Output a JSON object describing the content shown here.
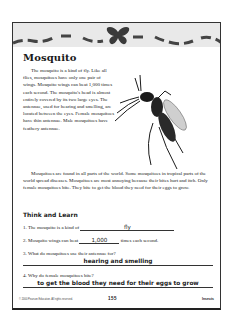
{
  "worksheet": {
    "title": "Mosquito",
    "paragraph1": "The mosquito is a kind of fly. Like all flies, mosquitoes have only one pair of wings. Mosquito wings can beat 1,000 times each second. The mosquito's head is almost entirely covered by its two large eyes. The antennae, used for hearing and smelling, are located between the eyes. Female mosquitoes have thin antennae. Male mosquitoes have feathery antennae.",
    "paragraph2": "Mosquitoes are found in all parts of the world. Some mosquitoes in tropical parts of the world spread diseases. Mosquitoes are most annoying because their bites hurt and itch. Only female mosquitoes bite. They bite to get the blood they need for their eggs to grow.",
    "section_heading": "Think and Learn",
    "questions": [
      {
        "number": "1.",
        "prompt": "The mosquito is a kind of",
        "answer": "fly",
        "suffix": ""
      },
      {
        "number": "2.",
        "prompt": "Mosquito wings can beat",
        "answer": "1,000",
        "suffix": "times each second."
      },
      {
        "number": "3.",
        "prompt": "What do mosquitoes use their antennae for?",
        "answer": "hearing and smelling",
        "suffix": ""
      },
      {
        "number": "4.",
        "prompt": "Why do female mosquitoes bite?",
        "answer": "to get the blood they need for their eggs to grow",
        "suffix": ""
      }
    ],
    "footer": {
      "copyright": "© 2000 Pearson Education. All rights reserved.",
      "page_number": "155",
      "section": "Insects"
    }
  },
  "colors": {
    "banner_bg": "#e9e9e9",
    "butterfly": "#3a3a3a",
    "frame": "#333333"
  }
}
